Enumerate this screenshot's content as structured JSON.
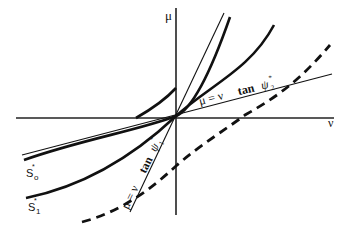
{
  "figure": {
    "axes": {
      "x_label": "ν",
      "y_label": "μ"
    },
    "curves": [
      {
        "id": "S0",
        "label_base": "S",
        "label_sub": "o",
        "label_sup": "*",
        "style": "thick-solid"
      },
      {
        "id": "S1",
        "label_base": "S",
        "label_sub": "1",
        "label_sup": "*",
        "style": "thick-solid"
      },
      {
        "id": "upper-thick",
        "style": "thick-solid"
      },
      {
        "id": "dashed",
        "style": "thick-dashed"
      }
    ],
    "lines": [
      {
        "id": "psi1",
        "label_pre": "μ = ν",
        "label_fn": "tan",
        "label_var": "ψ",
        "label_sub": "1",
        "label_sup": "*",
        "style": "thin-solid"
      },
      {
        "id": "psi2",
        "label_pre": "μ = ν",
        "label_fn": "tan",
        "label_var": "ψ",
        "label_sub": "2",
        "label_sup": "*",
        "style": "thin-solid"
      }
    ],
    "colors": {
      "ink": "#111111",
      "background": "#ffffff"
    }
  }
}
